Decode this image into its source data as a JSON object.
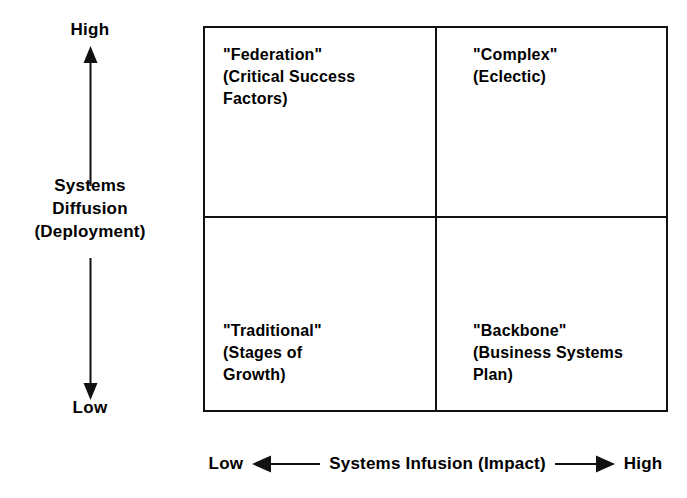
{
  "diagram": {
    "type": "2x2-matrix",
    "y_axis": {
      "title_lines": [
        "Systems",
        "Diffusion",
        "(Deployment)"
      ],
      "high_label": "High",
      "low_label": "Low",
      "arrow_up_icon": "arrow-up-icon",
      "arrow_down_icon": "arrow-down-icon"
    },
    "x_axis": {
      "title": "Systems Infusion (Impact)",
      "low_label": "Low",
      "high_label": "High",
      "arrow_left_icon": "arrow-left-icon",
      "arrow_right_icon": "arrow-right-icon"
    },
    "quadrants": [
      {
        "position": "top-left",
        "x_level": "Low",
        "y_level": "High",
        "lines": [
          "\"Federation\"",
          "(Critical Success",
          " Factors)"
        ]
      },
      {
        "position": "top-right",
        "x_level": "High",
        "y_level": "High",
        "lines": [
          "\"Complex\"",
          "(Eclectic)"
        ]
      },
      {
        "position": "bottom-left",
        "x_level": "Low",
        "y_level": "Low",
        "lines": [
          "\"Traditional\"",
          "(Stages of",
          " Growth)"
        ]
      },
      {
        "position": "bottom-right",
        "x_level": "High",
        "y_level": "Low",
        "lines": [
          "\"Backbone\"",
          "(Business Systems",
          " Plan)"
        ]
      }
    ],
    "colors": {
      "line": "#111111",
      "text": "#000000",
      "background": "#ffffff"
    }
  }
}
